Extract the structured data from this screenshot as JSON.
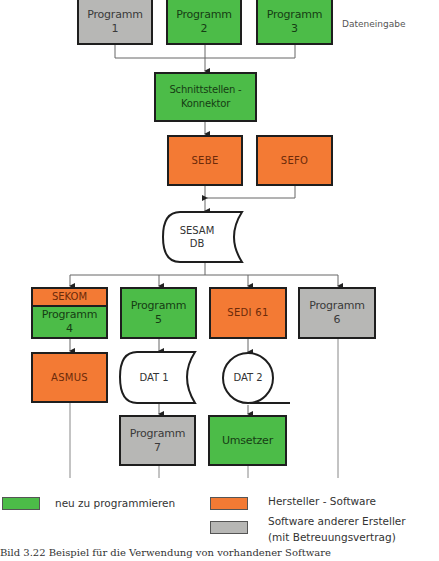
{
  "diagram": {
    "side_label": "Dateneingabe",
    "nodes": {
      "programm1": {
        "label": "Programm",
        "num": "1",
        "category": "gray"
      },
      "programm2": {
        "label": "Programm",
        "num": "2",
        "category": "green"
      },
      "programm3": {
        "label": "Programm",
        "num": "3",
        "category": "green"
      },
      "connector": {
        "line1": "Schnittstellen -",
        "line2": "Konnektor",
        "category": "green"
      },
      "sebe": {
        "label": "SEBE",
        "category": "orange"
      },
      "sefo": {
        "label": "SEFO",
        "category": "orange"
      },
      "sesam": {
        "line1": "SESAM",
        "line2": "DB",
        "shape": "stored-data"
      },
      "sekom": {
        "label": "SEKOM",
        "category": "orange"
      },
      "programm4": {
        "label": "Programm",
        "num": "4",
        "category": "green"
      },
      "programm5": {
        "label": "Programm",
        "num": "5",
        "category": "green"
      },
      "sedi": {
        "label": "SEDI 61",
        "category": "orange"
      },
      "programm6": {
        "label": "Programm",
        "num": "6",
        "category": "gray"
      },
      "asmus": {
        "label": "ASMUS",
        "category": "orange"
      },
      "dat1": {
        "label": "DAT 1",
        "shape": "stored-data"
      },
      "dat2": {
        "label": "DAT 2",
        "shape": "sequential-data"
      },
      "programm7": {
        "label": "Programm",
        "num": "7",
        "category": "gray"
      },
      "umsetzer": {
        "label": "Umsetzer",
        "category": "green"
      }
    },
    "colors": {
      "green": "#4cbc48",
      "orange": "#f37a34",
      "gray": "#b7b7b5",
      "line": "#555555",
      "border": "#1e1e1e"
    }
  },
  "legend": {
    "items": [
      {
        "color": "#4cbc48",
        "label": "neu zu programmieren"
      },
      {
        "color": "#f37a34",
        "label": "Hersteller - Software"
      },
      {
        "color": "#b7b7b5",
        "label": "Software anderer Ersteller",
        "label2": "(mit Betreuungsvertrag)"
      }
    ]
  },
  "caption": "Bild 3.22   Beispiel für die Verwendung von vorhandener Software"
}
